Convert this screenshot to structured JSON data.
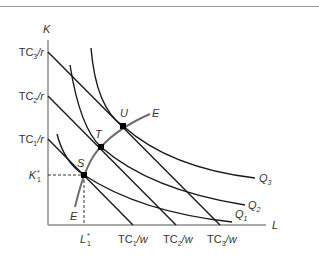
{
  "figure": {
    "axes": {
      "y_label": "K",
      "x_label": "L"
    },
    "y_ticks": [
      {
        "base": "TC",
        "sub": "3",
        "tail": "/r"
      },
      {
        "base": "TC",
        "sub": "2",
        "tail": "/r"
      },
      {
        "base": "TC",
        "sub": "1",
        "tail": "/r"
      },
      {
        "base": "K",
        "sub": "1",
        "sup": "*"
      }
    ],
    "x_ticks": [
      {
        "base": "L",
        "sub": "1",
        "sup": "*"
      },
      {
        "base": "TC",
        "sub": "1",
        "tail": "/w"
      },
      {
        "base": "TC",
        "sub": "2",
        "tail": "/w"
      },
      {
        "base": "TC",
        "sub": "3",
        "tail": "/w"
      }
    ],
    "isoquants": [
      {
        "base": "Q",
        "sub": "1"
      },
      {
        "base": "Q",
        "sub": "2"
      },
      {
        "base": "Q",
        "sub": "3"
      }
    ],
    "points": [
      "S",
      "T",
      "U"
    ],
    "expansion_path": "E",
    "colors": {
      "line": "#1a1a1a",
      "axis": "#8c8c8c",
      "path": "#6e6e6e"
    }
  }
}
